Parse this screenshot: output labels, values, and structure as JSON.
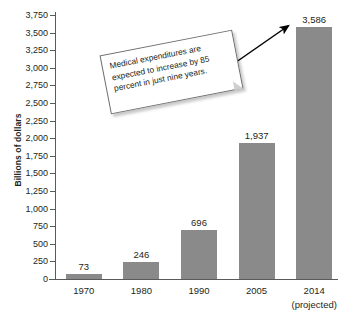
{
  "chart_data": {
    "type": "bar",
    "title": "",
    "title_sliver": "",
    "xlabel": "",
    "ylabel": "Billions of dollars",
    "categories": [
      "1970",
      "1980",
      "1990",
      "2005",
      "2014"
    ],
    "category_notes": [
      "",
      "",
      "",
      "",
      "(projected)"
    ],
    "values": [
      73,
      246,
      696,
      1937,
      3586
    ],
    "value_labels": [
      "73",
      "246",
      "696",
      "1,937",
      "3,586"
    ],
    "ylim": [
      0,
      3750
    ],
    "ytick_values": [
      0,
      250,
      500,
      750,
      1000,
      1250,
      1500,
      1750,
      2000,
      2250,
      2500,
      2750,
      3000,
      3250,
      3500,
      3750
    ],
    "ytick_labels": [
      "0",
      "250",
      "500",
      "750",
      "1,000",
      "1,250",
      "1,500",
      "1,750",
      "2,000",
      "2,250",
      "2,500",
      "2,750",
      "3,000",
      "3,250",
      "3,500",
      "3,750"
    ],
    "grid": false,
    "legend": "none",
    "bar_color": "#8a8a8a",
    "axis_color": "#5a5a5a",
    "background_color": "#ffffff"
  },
  "annotation": {
    "callout_text": "Medical expenditures are expected to increase by 85 percent in just nine years.",
    "arrow_target": "2014",
    "arrow_color": "#000000"
  }
}
